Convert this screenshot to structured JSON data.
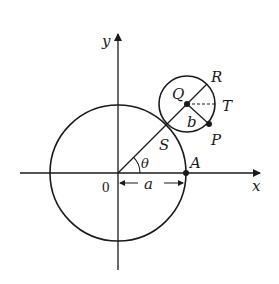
{
  "diagram": {
    "axes": {
      "x_label": "x",
      "y_label": "y",
      "origin_label": "0"
    },
    "points": {
      "A": "A",
      "S": "S",
      "Q": "Q",
      "R": "R",
      "T": "T",
      "P": "P"
    },
    "lengths": {
      "a": "a",
      "b": "b"
    },
    "angle": "θ",
    "colors": {
      "stroke": "#1a1a1a",
      "background": "#ffffff"
    }
  }
}
